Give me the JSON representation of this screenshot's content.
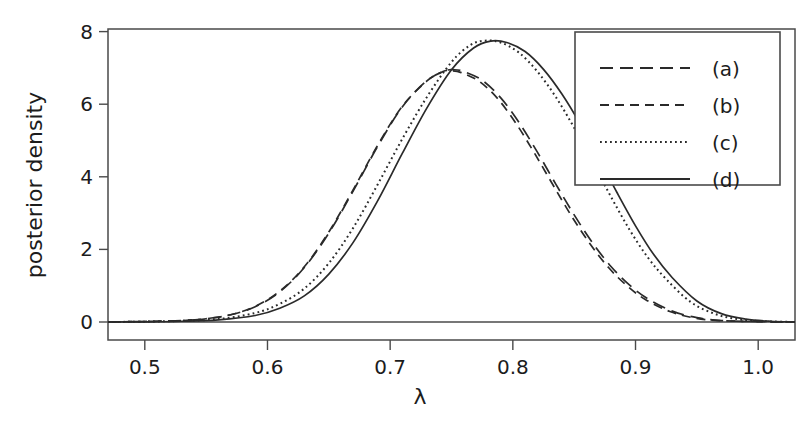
{
  "chart_data": {
    "type": "line",
    "title": "",
    "xlabel": "λ",
    "ylabel": "posterior density",
    "xlim": [
      0.47,
      1.03
    ],
    "ylim": [
      0,
      8.35
    ],
    "xticks": [
      0.5,
      0.6,
      0.7,
      0.8,
      0.9,
      1.0
    ],
    "xtick_labels": [
      "0.5",
      "0.6",
      "0.7",
      "0.8",
      "0.9",
      "1.0"
    ],
    "yticks": [
      0,
      2,
      4,
      6,
      8
    ],
    "ytick_labels": [
      "0",
      "2",
      "4",
      "6",
      "8"
    ],
    "grid": false,
    "legend_position": "upper right",
    "series": [
      {
        "name": "(a)",
        "linestyle": "longdash",
        "color": "#2a2a2a",
        "peak_x": 0.752,
        "peak_y": 6.95,
        "x": [
          0.47,
          0.49,
          0.51,
          0.53,
          0.55,
          0.57,
          0.59,
          0.61,
          0.63,
          0.65,
          0.67,
          0.69,
          0.71,
          0.73,
          0.745,
          0.752,
          0.76,
          0.775,
          0.79,
          0.805,
          0.82,
          0.835,
          0.85,
          0.865,
          0.88,
          0.895,
          0.91,
          0.93,
          0.95,
          0.97,
          1.0,
          1.03
        ],
        "y": [
          0.0,
          0.01,
          0.02,
          0.04,
          0.09,
          0.2,
          0.42,
          0.83,
          1.5,
          2.45,
          3.62,
          4.85,
          5.93,
          6.65,
          6.92,
          6.95,
          6.9,
          6.66,
          6.18,
          5.5,
          4.68,
          3.8,
          2.95,
          2.18,
          1.53,
          1.02,
          0.64,
          0.3,
          0.12,
          0.04,
          0.01,
          0.0
        ]
      },
      {
        "name": "(b)",
        "linestyle": "dash",
        "color": "#2a2a2a",
        "peak_x": 0.75,
        "peak_y": 6.92,
        "x": [
          0.47,
          0.49,
          0.51,
          0.53,
          0.55,
          0.57,
          0.59,
          0.61,
          0.63,
          0.65,
          0.67,
          0.69,
          0.71,
          0.73,
          0.743,
          0.75,
          0.758,
          0.773,
          0.788,
          0.803,
          0.818,
          0.833,
          0.848,
          0.863,
          0.878,
          0.893,
          0.908,
          0.928,
          0.948,
          0.968,
          1.0,
          1.03
        ],
        "y": [
          0.0,
          0.01,
          0.02,
          0.04,
          0.09,
          0.2,
          0.43,
          0.85,
          1.52,
          2.48,
          3.65,
          4.88,
          5.95,
          6.64,
          6.9,
          6.92,
          6.87,
          6.62,
          6.14,
          5.45,
          4.63,
          3.76,
          2.91,
          2.15,
          1.5,
          1.0,
          0.62,
          0.29,
          0.11,
          0.04,
          0.01,
          0.0
        ]
      },
      {
        "name": "(c)",
        "linestyle": "dotted",
        "color": "#2a2a2a",
        "peak_x": 0.777,
        "peak_y": 7.75,
        "x": [
          0.47,
          0.5,
          0.53,
          0.56,
          0.59,
          0.61,
          0.63,
          0.65,
          0.67,
          0.69,
          0.71,
          0.73,
          0.75,
          0.765,
          0.777,
          0.79,
          0.805,
          0.82,
          0.835,
          0.85,
          0.865,
          0.88,
          0.895,
          0.91,
          0.925,
          0.945,
          0.965,
          0.985,
          1.005,
          1.03
        ],
        "y": [
          0.0,
          0.01,
          0.03,
          0.08,
          0.25,
          0.5,
          0.92,
          1.62,
          2.6,
          3.8,
          5.05,
          6.2,
          7.16,
          7.62,
          7.75,
          7.7,
          7.42,
          6.9,
          6.2,
          5.35,
          4.4,
          3.45,
          2.55,
          1.78,
          1.18,
          0.55,
          0.22,
          0.07,
          0.02,
          0.0
        ]
      },
      {
        "name": "(d)",
        "linestyle": "solid",
        "color": "#2a2a2a",
        "peak_x": 0.782,
        "peak_y": 7.74,
        "x": [
          0.47,
          0.5,
          0.53,
          0.56,
          0.59,
          0.61,
          0.63,
          0.65,
          0.67,
          0.69,
          0.71,
          0.73,
          0.75,
          0.768,
          0.782,
          0.795,
          0.81,
          0.825,
          0.84,
          0.855,
          0.87,
          0.885,
          0.9,
          0.915,
          0.93,
          0.95,
          0.97,
          0.99,
          1.01,
          1.03
        ],
        "y": [
          0.0,
          0.005,
          0.02,
          0.06,
          0.18,
          0.38,
          0.72,
          1.32,
          2.2,
          3.35,
          4.65,
          5.9,
          6.95,
          7.55,
          7.74,
          7.7,
          7.45,
          6.96,
          6.28,
          5.45,
          4.52,
          3.56,
          2.65,
          1.85,
          1.22,
          0.58,
          0.23,
          0.08,
          0.02,
          0.0
        ]
      }
    ]
  },
  "axes": {
    "ylabel": "posterior density",
    "xlabel": "λ"
  },
  "legend": {
    "entries": [
      {
        "label": "(a)"
      },
      {
        "label": "(b)"
      },
      {
        "label": "(c)"
      },
      {
        "label": "(d)"
      }
    ]
  }
}
